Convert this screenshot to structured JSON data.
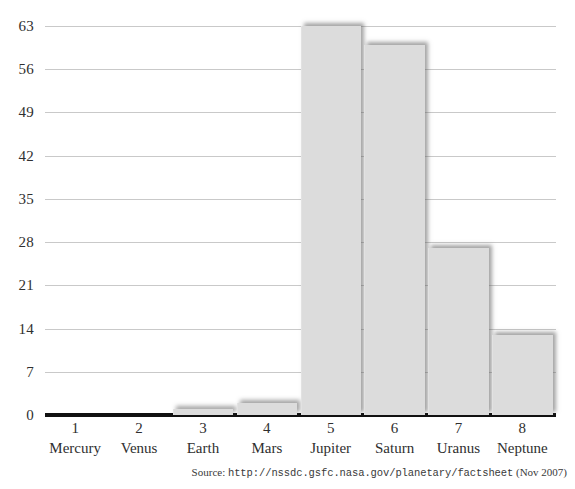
{
  "chart_data": {
    "type": "bar",
    "title": "",
    "subtitle": "",
    "xlabel": "",
    "ylabel": "",
    "categories": [
      "Mercury",
      "Venus",
      "Earth",
      "Mars",
      "Jupiter",
      "Saturn",
      "Uranus",
      "Neptune"
    ],
    "category_numbers": [
      "1",
      "2",
      "3",
      "4",
      "5",
      "6",
      "7",
      "8"
    ],
    "values": [
      0,
      0,
      1,
      2,
      63,
      60,
      27,
      13
    ],
    "ylim": [
      0,
      63
    ],
    "yticks": [
      0,
      7,
      14,
      21,
      28,
      35,
      42,
      49,
      56,
      63
    ],
    "ytick_labels": [
      "0",
      "7",
      "14",
      "21",
      "28",
      "35",
      "42",
      "49",
      "56",
      "63"
    ],
    "grid": true,
    "legend": "none",
    "bar_color": "#dcdcdc",
    "gridline_color": "#c9c9c9",
    "axis_color": "#111111",
    "text_color": "#2f2f2f",
    "background": "#ffffff"
  },
  "source_note": {
    "prefix": "Source:",
    "url": "http://nssdc.gsfc.nasa.gov/planetary/factsheet",
    "date": "(Nov 2007)"
  }
}
